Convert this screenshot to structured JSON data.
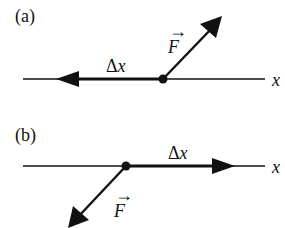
{
  "panels": [
    {
      "id": "a",
      "label": "(a)",
      "axis_label": "x",
      "displacement_label": "Δx",
      "displacement_direction": "negative-x",
      "force_label": "F",
      "force_direction": "up-right",
      "vector_arrow": "→"
    },
    {
      "id": "b",
      "label": "(b)",
      "axis_label": "x",
      "displacement_label": "Δx",
      "displacement_direction": "positive-x",
      "force_label": "F",
      "force_direction": "down-left",
      "vector_arrow": "→"
    }
  ],
  "colors": {
    "ink": "#111111",
    "background": "#ffffff"
  }
}
